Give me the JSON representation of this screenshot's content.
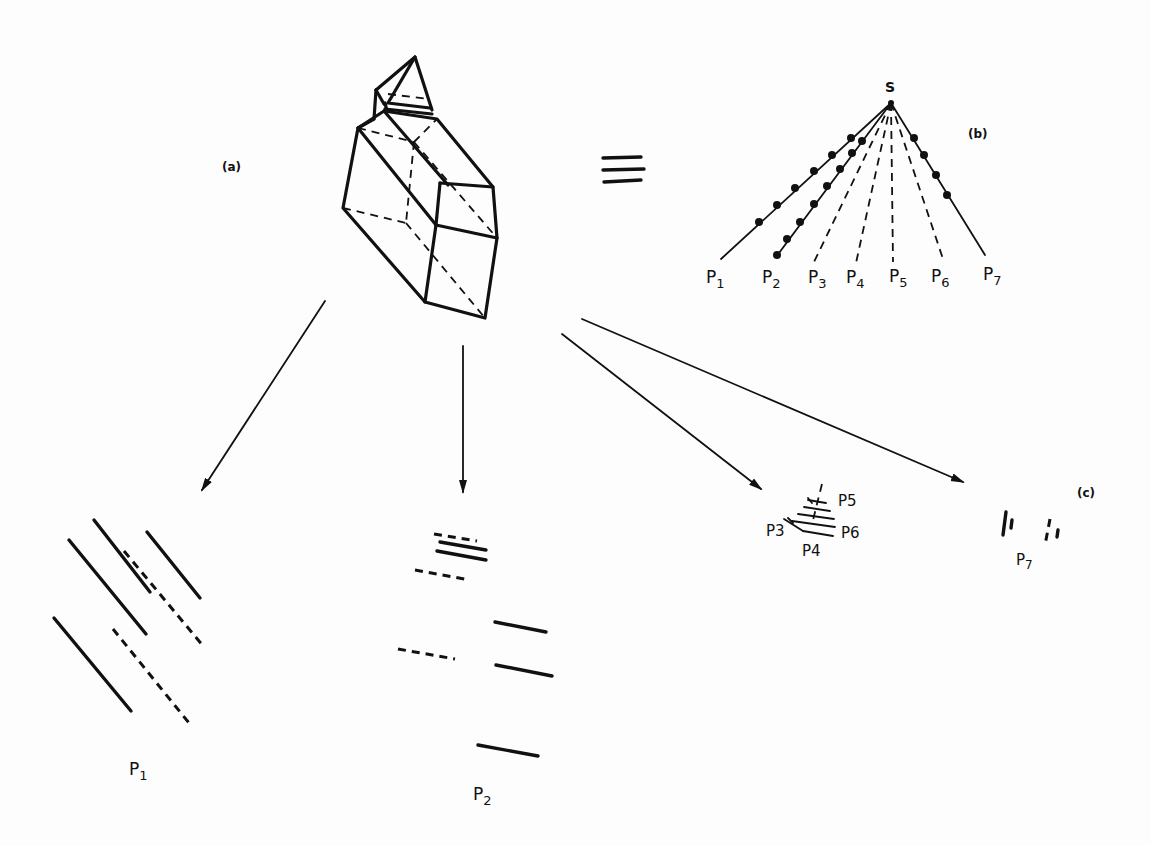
{
  "panels": {
    "a": {
      "label": "(a)"
    },
    "b": {
      "label": "(b)"
    },
    "c": {
      "label": "(c)"
    }
  },
  "fan": {
    "source_label": "S",
    "rays": [
      {
        "label": "P",
        "sub": "1",
        "style": "solid-dotted"
      },
      {
        "label": "P",
        "sub": "2",
        "style": "solid-dotted"
      },
      {
        "label": "P",
        "sub": "3",
        "style": "dashed"
      },
      {
        "label": "P",
        "sub": "4",
        "style": "dashed"
      },
      {
        "label": "P",
        "sub": "5",
        "style": "dashed"
      },
      {
        "label": "P",
        "sub": "6",
        "style": "dashed"
      },
      {
        "label": "P",
        "sub": "7",
        "style": "solid-dotted"
      }
    ]
  },
  "equivalence_symbol": "≡",
  "projections": {
    "p1": {
      "label": "P",
      "sub": "1"
    },
    "p2": {
      "label": "P",
      "sub": "2"
    },
    "p3456": {
      "labels": [
        "P3",
        "P4",
        "P5",
        "P6"
      ]
    },
    "p7": {
      "label": "P",
      "sub": "7"
    }
  },
  "colors": {
    "ink": "#111111",
    "paper": "#fdfdfd"
  }
}
